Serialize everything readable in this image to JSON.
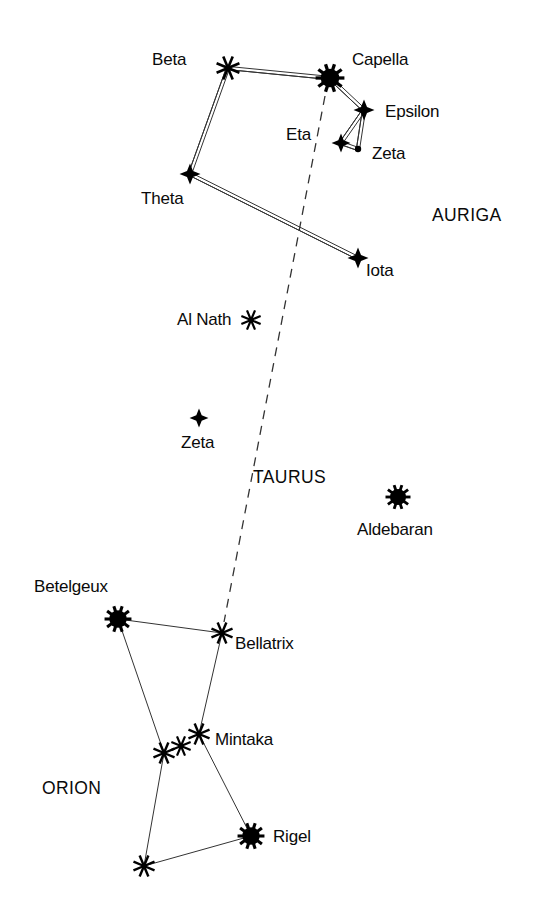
{
  "chart_data": {
    "type": "scatter",
    "title": "",
    "subtitle": "",
    "xlabel": "",
    "ylabel": "",
    "grid": false,
    "legend_position": "none",
    "xlim": [
      0,
      547
    ],
    "ylim": [
      0,
      919
    ],
    "magnitude_marker_key": {
      "brightest": "filled disc with radiating spikes",
      "bright": "eight-pointed asterisk",
      "medium": "four-pointed star",
      "faint": "small filled dot"
    },
    "constellations": [
      {
        "name": "AURIGA",
        "label_x": 432,
        "label_y": 207,
        "line_style": "double",
        "stars": [
          {
            "id": "auriga-beta",
            "name": "Beta",
            "x": 228,
            "y": 68,
            "marker": "asterisk",
            "size": 13,
            "label_x": 152,
            "label_y": 51,
            "label_align": "left"
          },
          {
            "id": "auriga-capella",
            "name": "Capella",
            "x": 330,
            "y": 78,
            "marker": "disc",
            "size": 15,
            "label_x": 352,
            "label_y": 51,
            "label_align": "left"
          },
          {
            "id": "auriga-epsilon",
            "name": "Epsilon",
            "x": 364,
            "y": 110,
            "marker": "cross-star",
            "size": 10,
            "label_x": 385,
            "label_y": 103,
            "label_align": "left"
          },
          {
            "id": "auriga-eta",
            "name": "Eta",
            "x": 341,
            "y": 143,
            "marker": "cross-star",
            "size": 9,
            "label_x": 286,
            "label_y": 126,
            "label_align": "left"
          },
          {
            "id": "auriga-zeta",
            "name": "Zeta",
            "x": 358,
            "y": 149,
            "marker": "dot",
            "size": 4,
            "label_x": 372,
            "label_y": 145,
            "label_align": "left"
          },
          {
            "id": "auriga-theta",
            "name": "Theta",
            "x": 190,
            "y": 174,
            "marker": "cross-star",
            "size": 10,
            "label_x": 141,
            "label_y": 190,
            "label_align": "left"
          },
          {
            "id": "auriga-iota",
            "name": "Iota",
            "x": 358,
            "y": 258,
            "marker": "cross-star",
            "size": 10,
            "label_x": 366,
            "label_y": 262,
            "label_align": "left"
          }
        ],
        "lines": [
          [
            "auriga-beta",
            "auriga-capella"
          ],
          [
            "auriga-capella",
            "auriga-epsilon"
          ],
          [
            "auriga-epsilon",
            "auriga-eta"
          ],
          [
            "auriga-epsilon",
            "auriga-zeta"
          ],
          [
            "auriga-eta",
            "auriga-zeta"
          ],
          [
            "auriga-beta",
            "auriga-theta"
          ],
          [
            "auriga-theta",
            "auriga-iota"
          ]
        ]
      },
      {
        "name": "TAURUS",
        "label_x": 253,
        "label_y": 469,
        "line_style": "none",
        "stars": [
          {
            "id": "taurus-alnath",
            "name": "Al Nath",
            "x": 251,
            "y": 320,
            "marker": "asterisk",
            "size": 11,
            "label_x": 177,
            "label_y": 311,
            "label_align": "left"
          },
          {
            "id": "taurus-zeta",
            "name": "Zeta",
            "x": 199,
            "y": 418,
            "marker": "cross-star",
            "size": 9,
            "label_x": 181,
            "label_y": 434,
            "label_align": "left"
          },
          {
            "id": "taurus-aldebaran",
            "name": "Aldebaran",
            "x": 398,
            "y": 497,
            "marker": "disc",
            "size": 13,
            "label_x": 357,
            "label_y": 521,
            "label_align": "left"
          }
        ],
        "lines": []
      },
      {
        "name": "ORION",
        "label_x": 42,
        "label_y": 780,
        "line_style": "single",
        "stars": [
          {
            "id": "orion-betelgeux",
            "name": "Betelgeux",
            "x": 118,
            "y": 619,
            "marker": "disc",
            "size": 14,
            "label_x": 34,
            "label_y": 578,
            "label_align": "left"
          },
          {
            "id": "orion-bellatrix",
            "name": "Bellatrix",
            "x": 222,
            "y": 633,
            "marker": "asterisk",
            "size": 12,
            "label_x": 235,
            "label_y": 635,
            "label_align": "left"
          },
          {
            "id": "orion-mintaka",
            "name": "Mintaka",
            "x": 199,
            "y": 734,
            "marker": "asterisk",
            "size": 12,
            "label_x": 215,
            "label_y": 731,
            "label_align": "left"
          },
          {
            "id": "orion-belt-mid",
            "name": "",
            "x": 181,
            "y": 746,
            "marker": "asterisk",
            "size": 11,
            "label_x": 0,
            "label_y": 0,
            "label_align": "left"
          },
          {
            "id": "orion-belt-end",
            "name": "",
            "x": 164,
            "y": 753,
            "marker": "asterisk",
            "size": 12,
            "label_x": 0,
            "label_y": 0,
            "label_align": "left"
          },
          {
            "id": "orion-rigel",
            "name": "Rigel",
            "x": 251,
            "y": 836,
            "marker": "disc",
            "size": 14,
            "label_x": 273,
            "label_y": 828,
            "label_align": "left"
          },
          {
            "id": "orion-saiph",
            "name": "",
            "x": 144,
            "y": 866,
            "marker": "asterisk",
            "size": 12,
            "label_x": 0,
            "label_y": 0,
            "label_align": "left"
          }
        ],
        "lines": [
          [
            "orion-betelgeux",
            "orion-bellatrix"
          ],
          [
            "orion-betelgeux",
            "orion-belt-end"
          ],
          [
            "orion-bellatrix",
            "orion-mintaka"
          ],
          [
            "orion-mintaka",
            "orion-rigel"
          ],
          [
            "orion-belt-end",
            "orion-saiph"
          ],
          [
            "orion-saiph",
            "orion-rigel"
          ]
        ]
      }
    ],
    "pointer_line": {
      "name": "dashed pointer line",
      "style": "dashed",
      "from": {
        "x": 325,
        "y": 96
      },
      "to": {
        "x": 224,
        "y": 622
      }
    },
    "colors": {
      "ink": "#000000",
      "background": "#ffffff",
      "line": "#333333"
    }
  }
}
